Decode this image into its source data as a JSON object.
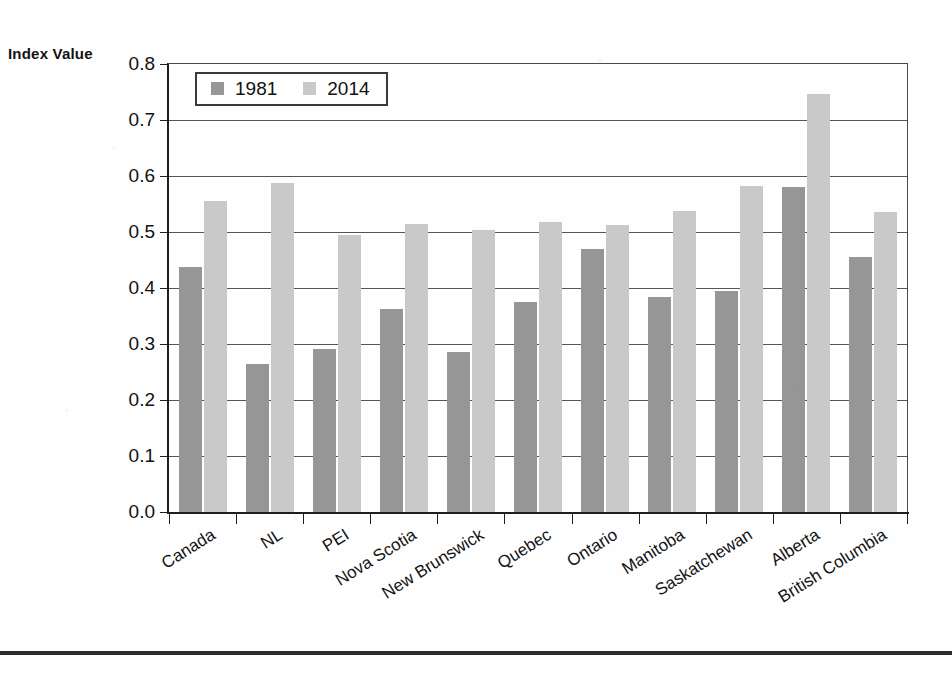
{
  "axis_title": "Index Value",
  "legend": {
    "entries": [
      {
        "label": "1981",
        "color": "#969696"
      },
      {
        "label": "2014",
        "color": "#c9c9c9"
      }
    ]
  },
  "colors": {
    "series_1981": "#969696",
    "series_2014": "#c9c9c9",
    "axis": "#1e1e1e",
    "gridline": "#555555",
    "text": "#121212",
    "background": "#ffffff"
  },
  "chart_data": {
    "type": "bar",
    "title": "",
    "xlabel": "",
    "ylabel": "Index Value",
    "ylim": [
      0.0,
      0.8
    ],
    "yticks": [
      "0.0",
      "0.1",
      "0.2",
      "0.3",
      "0.4",
      "0.5",
      "0.6",
      "0.7",
      "0.8"
    ],
    "grid": true,
    "legend_position": "top-left",
    "categories": [
      "Canada",
      "NL",
      "PEI",
      "Nova Scotia",
      "New Brunswick",
      "Quebec",
      "Ontario",
      "Manitoba",
      "Saskatchewan",
      "Alberta",
      "British Columbia"
    ],
    "series": [
      {
        "name": "1981",
        "color": "#969696",
        "values": [
          0.437,
          0.264,
          0.291,
          0.362,
          0.286,
          0.375,
          0.47,
          0.384,
          0.395,
          0.58,
          0.456
        ]
      },
      {
        "name": "2014",
        "color": "#c9c9c9",
        "values": [
          0.556,
          0.588,
          0.494,
          0.514,
          0.504,
          0.518,
          0.512,
          0.538,
          0.583,
          0.746,
          0.536
        ]
      }
    ]
  }
}
